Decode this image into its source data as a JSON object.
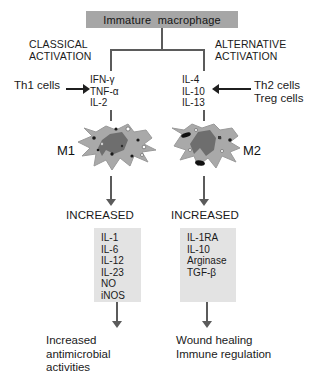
{
  "figure": {
    "width": 327,
    "height": 380,
    "background": "#ffffff"
  },
  "colors": {
    "header_box_fill": "#a6a6a6",
    "mediator_box_fill": "#e3e3e3",
    "connector_line": "#5b5b5b",
    "arrow_black": "#1f1f1f",
    "text": "#1a1a1a",
    "cell_cytoplasm": "#a9a9a9",
    "cell_nucleus": "#6e6e6e",
    "granule_dark": "#1a1a1a",
    "granule_light": "#ffffff"
  },
  "header": {
    "label": "Immature  macrophage"
  },
  "branches": {
    "classical": {
      "activation_label": "CLASSICAL\nACTIVATION",
      "source_cells": "Th1 cells",
      "cytokines": [
        "IFN-γ",
        "TNF-α",
        "IL-2"
      ],
      "cytokines_text": "IFN-γ\nTNF-α\nIL-2",
      "cell_label": "M1",
      "increased_label": "INCREASED",
      "mediators": [
        "IL-1",
        "IL-6",
        "IL-12",
        "IL-23",
        "NO",
        "iNOS"
      ],
      "mediators_text": "IL-1\nIL-6\nIL-12\nIL-23\nNO\niNOS",
      "outcome": "Increased\nantimicrobial\nactivities",
      "arrow_direction": "right"
    },
    "alternative": {
      "activation_label": "ALTERNATIVE\nACTIVATION",
      "source_cells": "Th2 cells\nTreg cells",
      "cytokines": [
        "IL-4",
        "IL-10",
        "IL-13"
      ],
      "cytokines_text": "IL-4\nIL-10\nIL-13",
      "cell_label": "M2",
      "increased_label": "INCREASED",
      "mediators": [
        "IL-1RA",
        "IL-10",
        "Arginase",
        "TGF-β"
      ],
      "mediators_text": "IL-1RA\nIL-10\nArginase\nTGF-β",
      "outcome": "Wound healing\nImmune regulation",
      "arrow_direction": "left"
    }
  }
}
